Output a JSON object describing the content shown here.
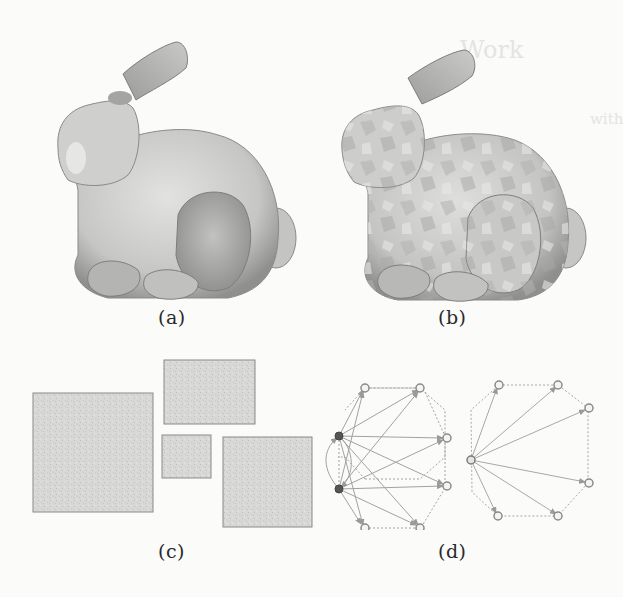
{
  "figure": {
    "subfigures": [
      {
        "id": "a",
        "caption": "(a)",
        "content": "shaded bunny mesh, coarse segmentation"
      },
      {
        "id": "b",
        "caption": "(b)",
        "content": "shaded bunny mesh, fine patch segmentation"
      },
      {
        "id": "c",
        "caption": "(c)",
        "content": "packed rectangles"
      },
      {
        "id": "d",
        "caption": "(d)",
        "content": "directed graphs on octagon vertices"
      }
    ]
  },
  "bleed_through": {
    "heading_fragment": "Work",
    "line_fragment": "with"
  },
  "colors": {
    "paper": "#fbfbfa",
    "mesh_light": "#d8d8d6",
    "mesh_dark": "#8f8f8d",
    "rect_fill": "#d6d6d4",
    "rect_border": "#8a8a88",
    "edge": "#9a9a98",
    "hub_node": "#555555",
    "node_ring": "#8a8a88"
  }
}
